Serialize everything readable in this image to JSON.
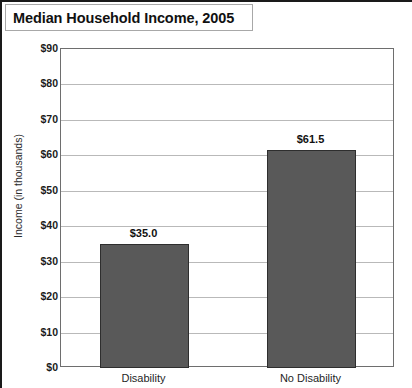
{
  "figure": {
    "title": "Median Household Income, 2005"
  },
  "chart_data": {
    "type": "bar",
    "title": "Median Household Income, 2005",
    "xlabel": "",
    "ylabel": "Income (in thousands)",
    "categories": [
      "Disability",
      "No Disability"
    ],
    "values": [
      35.0,
      61.5
    ],
    "data_labels": [
      "$35.0",
      "$61.5"
    ],
    "ylim": [
      0,
      90
    ],
    "ytick_values": [
      0,
      10,
      20,
      30,
      40,
      50,
      60,
      70,
      80,
      90
    ],
    "ytick_labels": [
      "$0",
      "$10",
      "$20",
      "$30",
      "$40",
      "$50",
      "$60",
      "$70",
      "$80",
      "$90"
    ],
    "grid": true,
    "legend": false,
    "bar_color": "#595959",
    "bar_edge_color": "#2e2e2e",
    "gridline_color": "#b9b9b9",
    "axis_color": "#6e6e6e",
    "background": "#ffffff"
  }
}
